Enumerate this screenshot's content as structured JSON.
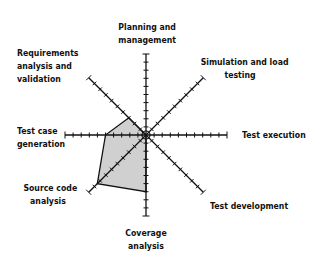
{
  "chart_data": {
    "type": "radar",
    "title": "",
    "axes": [
      "Planning and management",
      "Simulation and load testing",
      "Test execution",
      "Test development",
      "Coverage analysis",
      "Source code analysis",
      "Test case generation",
      "Requirements analysis and validation"
    ],
    "scale": {
      "min": 0,
      "max": 10,
      "ticks": 10
    },
    "series": [
      {
        "name": "Coverage",
        "values": [
          0,
          0,
          0,
          0,
          7,
          8.5,
          5,
          3
        ],
        "fill": "#d0d0d0",
        "stroke": "#111111"
      }
    ],
    "grid": false,
    "legend": "none"
  },
  "labels": {
    "planning": [
      "Planning and",
      "management"
    ],
    "simulation": [
      "Simulation and load",
      "testing"
    ],
    "execution": [
      "Test execution"
    ],
    "development": [
      "Test development"
    ],
    "coverage": [
      "Coverage",
      "analysis"
    ],
    "source": [
      "Source code",
      "analysis"
    ],
    "testcase": [
      "Test case",
      "generation"
    ],
    "requirements": [
      "Requirements",
      "analysis and",
      "validation"
    ]
  }
}
